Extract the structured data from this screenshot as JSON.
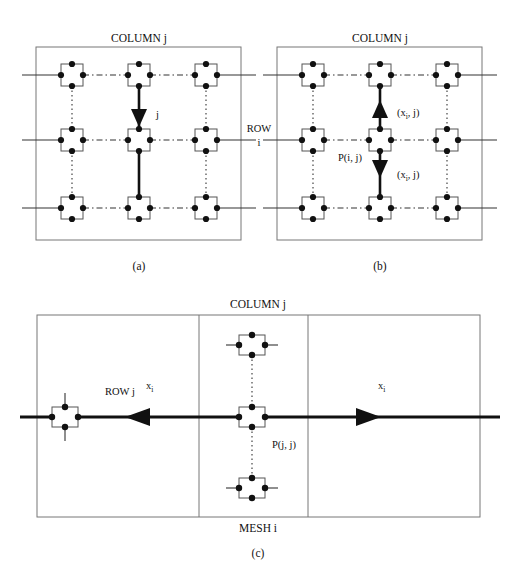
{
  "figure": {
    "caption_a": "(a)",
    "caption_b": "(b)",
    "caption_c": "(c)",
    "colors": {
      "ink": "#111111",
      "frame": "#555555",
      "thin_line": "#333333",
      "background": "#ffffff"
    }
  },
  "panel_a": {
    "header": "COLUMN j",
    "arrow_label": "j",
    "caption": "(a)",
    "grid": {
      "rows": 3,
      "cols": 3
    },
    "highlight_column_index": 1,
    "arrow_direction": "down"
  },
  "shared": {
    "row_label_line1": "ROW",
    "row_label_line2": "i"
  },
  "panel_b": {
    "header": "COLUMN j",
    "caption": "(b)",
    "node_label": "P(i, j)",
    "up_arrow_label": {
      "prefix": "(x",
      "sub": "i",
      "suffix": ", j)"
    },
    "down_arrow_label": {
      "prefix": "(x",
      "sub": "i",
      "suffix": ", j)"
    },
    "grid": {
      "rows": 3,
      "cols": 3
    },
    "highlight_column_index": 1
  },
  "panel_c": {
    "header": "COLUMN j",
    "footer": "MESH i",
    "caption": "(c)",
    "row_label": "ROW j",
    "node_label": "P(j, j)",
    "left_flow_label": {
      "prefix": "x",
      "sub": "i"
    },
    "right_flow_label": {
      "prefix": "x",
      "sub": "i"
    },
    "left_arrow_direction": "left",
    "right_arrow_direction": "right",
    "column_cells": 3
  }
}
